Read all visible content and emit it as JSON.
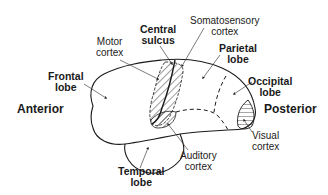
{
  "diagram": {
    "labels": {
      "motor_cortex": [
        "Motor",
        "cortex"
      ],
      "central_sulcus": [
        "Central",
        "sulcus"
      ],
      "somatosensory_cortex": [
        "Somatosensory",
        "cortex"
      ],
      "parietal_lobe": [
        "Parietal",
        "lobe"
      ],
      "frontal_lobe": [
        "Frontal",
        "lobe"
      ],
      "occipital_lobe": [
        "Occipital",
        "lobe"
      ],
      "anterior": "Anterior",
      "posterior": "Posterior",
      "visual_cortex": [
        "Visual",
        "cortex"
      ],
      "auditory_cortex": [
        "Auditory",
        "cortex"
      ],
      "temporal_lobe": [
        "Temporal",
        "lobe"
      ]
    },
    "colors": {
      "outline": "#1a1a1a",
      "background": "#ffffff"
    }
  }
}
